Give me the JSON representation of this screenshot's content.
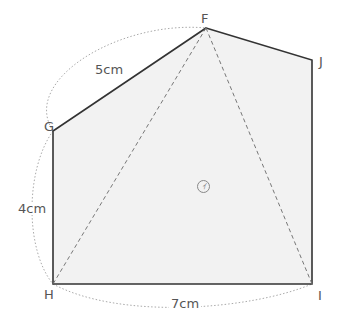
{
  "figure": {
    "type": "pentagon-geometry",
    "vertices": [
      {
        "name": "F",
        "x": 206,
        "y": 28
      },
      {
        "name": "J",
        "x": 312,
        "y": 60
      },
      {
        "name": "I",
        "x": 312,
        "y": 284
      },
      {
        "name": "H",
        "x": 53,
        "y": 284
      },
      {
        "name": "G",
        "x": 53,
        "y": 131
      }
    ],
    "labels": {
      "F": "F",
      "J": "J",
      "I": "I",
      "H": "H",
      "G": "G",
      "region": "ｲ"
    },
    "measurements": {
      "FG": "5cm",
      "GH": "4cm",
      "HI": "7cm"
    },
    "colors": {
      "fill": "#f2f2f2",
      "edge": "#333333",
      "dashed": "#777777",
      "dotted_arc": "#aaaaaa",
      "text": "#555555"
    }
  }
}
